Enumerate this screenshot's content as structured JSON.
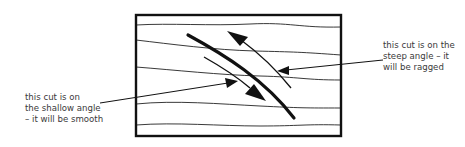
{
  "diagram": {
    "colors": {
      "ink": "#111111",
      "text": "#3a3a3a",
      "background": "#ffffff"
    },
    "labels": {
      "steep": {
        "lines": [
          "this cut is on the",
          "steep angle – it",
          "will be ragged"
        ]
      },
      "shallow": {
        "lines": [
          "this cut is on",
          "the shallow angle",
          "– it will be smooth"
        ]
      }
    }
  }
}
